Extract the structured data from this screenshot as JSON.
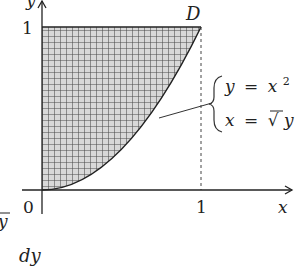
{
  "figure": {
    "type": "region-diagram",
    "axes": {
      "x_label": "x",
      "y_label": "y",
      "origin_label": "0",
      "x_tick_label": "1",
      "y_tick_label": "1"
    },
    "point_label": "D",
    "equations": {
      "line1": {
        "lhs": "y",
        "eq": "=",
        "rhs": "x",
        "sup": "2"
      },
      "line2": {
        "lhs": "x",
        "eq": "=",
        "rhs": "√y",
        "rad": "√",
        "radicand": "y"
      }
    },
    "region": "area bounded by y-axis, y = 1, and curve y = x² (shaded with grid hatching)",
    "dashed_line": "x = 1 vertical guide from D to x-axis",
    "fragment_left": "y",
    "fragment_bottom": "dy"
  },
  "colors": {
    "ink": "#222222",
    "hatch_fill": "#d8d8d8",
    "hatch_line": "#555555"
  }
}
